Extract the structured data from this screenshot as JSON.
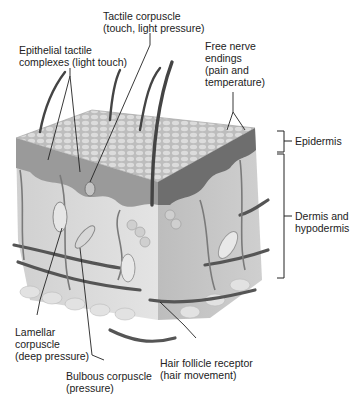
{
  "diagram": {
    "labels": {
      "tactile_corpuscle": "Tactile corpuscle\n(touch, light pressure)",
      "epithelial_tactile": "Epithelial tactile\ncomplexes (light touch)",
      "free_nerve": "Free nerve\nendings\n(pain and\ntemperature)",
      "epidermis": "Epidermis",
      "dermis": "Dermis and\nhypodermis",
      "lamellar": "Lamellar\ncorpuscle\n(deep pressure)",
      "bulbous": "Bulbous corpuscle\n(pressure)",
      "hair_follicle": "Hair follicle receptor\n(hair movement)"
    },
    "colors": {
      "epidermis_top": "#c8c8c8",
      "epidermis_side": "#8a8a8a",
      "dermis": "#d6d6d6",
      "vessels": "#555555",
      "hair": "#444444"
    }
  }
}
